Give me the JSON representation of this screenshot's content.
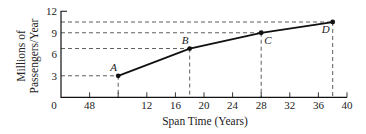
{
  "chart_data": {
    "type": "line",
    "title": "",
    "xlabel": "Span Time (Years)",
    "ylabel_lines": [
      "Millions of",
      "Passengers/Year"
    ],
    "ylabel": "Millions of Passengers/Year",
    "xlim": [
      0,
      40
    ],
    "ylim": [
      0,
      12
    ],
    "grid": false,
    "legend": null,
    "x_ticks": [
      {
        "value": 4,
        "label": "48"
      },
      {
        "value": 8,
        "label": ""
      },
      {
        "value": 12,
        "label": "12"
      },
      {
        "value": 16,
        "label": "16"
      },
      {
        "value": 20,
        "label": "20"
      },
      {
        "value": 24,
        "label": "24"
      },
      {
        "value": 28,
        "label": "28"
      },
      {
        "value": 32,
        "label": "32"
      },
      {
        "value": 36,
        "label": "36"
      },
      {
        "value": 40,
        "label": "40"
      }
    ],
    "origin_label": "0",
    "y_ticks": [
      {
        "value": 3,
        "label": "3"
      },
      {
        "value": 6,
        "label": "6"
      },
      {
        "value": 9,
        "label": "9"
      },
      {
        "value": 12,
        "label": "12"
      }
    ],
    "series": [
      {
        "name": "Passenger demand",
        "points": [
          {
            "label": "A",
            "x": 8,
            "y": 3.0,
            "label_dx": -8,
            "label_dy": -5
          },
          {
            "label": "B",
            "x": 18,
            "y": 6.8,
            "label_dx": -8,
            "label_dy": -5
          },
          {
            "label": "C",
            "x": 28,
            "y": 9.0,
            "label_dx": 3,
            "label_dy": 11
          },
          {
            "label": "D",
            "x": 38,
            "y": 10.5,
            "label_dx": -11,
            "label_dy": 11
          }
        ]
      }
    ],
    "guides": "dashed lines from each point to both axes"
  },
  "layout": {
    "origin_px": [
      61,
      97.3
    ],
    "px_per_x": 7.15,
    "px_per_y": 7.17
  }
}
